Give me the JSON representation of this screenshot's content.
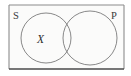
{
  "diagram": {
    "type": "venn",
    "background_color": "#ffffff",
    "universe": {
      "label": "universe-box",
      "fill_color": "#fbfbfa",
      "border_color": "#8c8c8c",
      "bottom_border_color": "#4a4a4a",
      "x": 9,
      "y": 5,
      "width": 115,
      "height": 64
    },
    "labels": [
      {
        "id": "label-s",
        "text": "S",
        "x": 14,
        "y": 18,
        "font_size": 10,
        "color": "#3a3a3a",
        "position": "top-left"
      },
      {
        "id": "label-p",
        "text": "P",
        "x": 112,
        "y": 18,
        "font_size": 10,
        "color": "#3a3a3a",
        "position": "top-right"
      }
    ],
    "circles": [
      {
        "id": "circle-s",
        "name": "subject-circle",
        "cx": 46,
        "cy": 38,
        "r": 25,
        "stroke_color": "#7a7a7a",
        "stroke_width": 0.9
      },
      {
        "id": "circle-p",
        "name": "predicate-circle",
        "cx": 90,
        "cy": 38,
        "r": 27,
        "stroke_color": "#7a7a7a",
        "stroke_width": 0.9
      }
    ],
    "marks": [
      {
        "id": "mark-x",
        "text": "X",
        "region": "s-only",
        "x": 40,
        "y": 43,
        "font_size": 11,
        "color": "#2b2b2b"
      }
    ]
  }
}
